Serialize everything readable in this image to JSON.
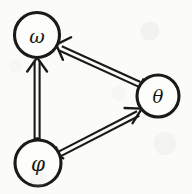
{
  "diagram": {
    "type": "directed-graph",
    "title": "",
    "background_color": "#fbfbfa",
    "ink_color": "#1b1a18",
    "style": "hand-drawn scanned double-line arrows",
    "width": 192,
    "height": 194,
    "nodes": [
      {
        "id": "omega",
        "label": "ω",
        "name": "omega",
        "cx": 37,
        "cy": 35,
        "r": 22.5,
        "font_size": 19,
        "position": "top-left"
      },
      {
        "id": "theta",
        "label": "θ",
        "name": "theta",
        "cx": 158,
        "cy": 96,
        "r": 21,
        "font_size": 18,
        "position": "right"
      },
      {
        "id": "phi",
        "label": "φ",
        "name": "phi",
        "cx": 38,
        "cy": 163,
        "r": 23,
        "font_size": 20,
        "position": "bottom-left"
      }
    ],
    "edges": [
      {
        "id": "phi-to-omega",
        "name": "edge-phi-to-omega",
        "from": "phi",
        "to": "omega",
        "label": "",
        "arrowhead_at": "omega",
        "style": "double-line"
      },
      {
        "id": "phi-to-theta",
        "name": "edge-phi-to-theta",
        "from": "phi",
        "to": "theta",
        "label": "",
        "arrowhead_at": "theta",
        "style": "double-line"
      },
      {
        "id": "theta-to-omega",
        "name": "edge-theta-to-omega",
        "from": "theta",
        "to": "omega",
        "label": "",
        "arrowhead_at": "omega",
        "style": "double-line"
      }
    ]
  }
}
